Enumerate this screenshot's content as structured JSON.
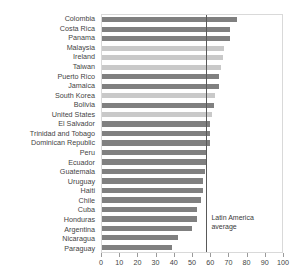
{
  "chart_data": {
    "type": "bar",
    "orientation": "horizontal",
    "title": "",
    "clipped_title": "",
    "xlabel": "",
    "ylabel": "",
    "xlim": [
      0,
      100
    ],
    "xticks": [
      0,
      10,
      20,
      30,
      40,
      50,
      60,
      70,
      80,
      90,
      100
    ],
    "grid": false,
    "legend": "none",
    "categories": [
      "Colombia",
      "Costa Rica",
      "Panama",
      "Malaysia",
      "Ireland",
      "Taiwan",
      "Puerto Rico",
      "Jamaica",
      "South Korea",
      "Bolivia",
      "United States",
      "El Salvador",
      "Trinidad and Tobago",
      "Dominican Republic",
      "Peru",
      "Ecuador",
      "Guatemala",
      "Uruguay",
      "Haiti",
      "Chile",
      "Cuba",
      "Honduras",
      "Argentina",
      "Nicaragua",
      "Paraguay"
    ],
    "values": [
      75,
      71,
      71,
      68,
      67,
      66,
      65,
      65,
      63,
      62,
      61,
      60,
      60,
      60,
      58,
      58,
      57,
      56,
      56,
      55,
      53,
      53,
      50,
      42,
      39
    ],
    "bar_shades": [
      "dark",
      "dark",
      "dark",
      "light",
      "light",
      "light",
      "dark",
      "dark",
      "light",
      "dark",
      "light",
      "dark",
      "dark",
      "dark",
      "dark",
      "dark",
      "dark",
      "dark",
      "dark",
      "dark",
      "dark",
      "dark",
      "dark",
      "dark",
      "dark"
    ],
    "annotations": [
      {
        "name": "latin-america-average",
        "line1": "Latin America",
        "line2": "average",
        "value": 58
      }
    ],
    "colors": {
      "bar_dark": "#808080",
      "bar_light": "#c9c9c9",
      "average_line": "#595959",
      "frame": "#d9d9d9",
      "text": "#444444"
    }
  }
}
